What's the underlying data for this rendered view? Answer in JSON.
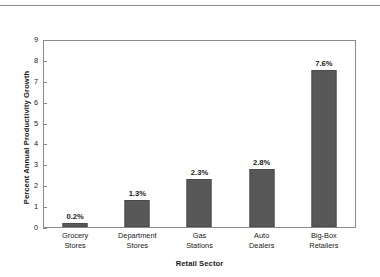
{
  "chart_data": {
    "type": "bar",
    "title": "",
    "subtitle": "",
    "xlabel": "Retail Sector",
    "ylabel": "Percent Annual Productivity Growth",
    "categories": [
      "Grocery Stores",
      "Department Stores",
      "Gas Stations",
      "Auto Dealers",
      "Big-Box Retailers"
    ],
    "category_lines": [
      [
        "Grocery",
        "Stores"
      ],
      [
        "Department",
        "Stores"
      ],
      [
        "Gas",
        "Stations"
      ],
      [
        "Auto",
        "Dealers"
      ],
      [
        "Big-Box",
        "Retailers"
      ]
    ],
    "values": [
      0.2,
      1.3,
      2.3,
      2.8,
      7.6
    ],
    "data_labels": [
      "0.2%",
      "1.3%",
      "2.3%",
      "2.8%",
      "7.6%"
    ],
    "ylim": [
      0,
      9
    ],
    "ytick_values": [
      0,
      1,
      2,
      3,
      4,
      5,
      6,
      7,
      8,
      9
    ],
    "ytick_labels": [
      "0",
      "1",
      "2",
      "3",
      "4",
      "5",
      "6",
      "7",
      "8",
      "9"
    ],
    "grid": false,
    "legend": null,
    "legend_position": "none",
    "bar_color": "#585858",
    "axis_color": "#8a8a8a",
    "plot_background": "#ffffff"
  },
  "figure": {
    "top_rule_color": "#8d8d8d"
  }
}
